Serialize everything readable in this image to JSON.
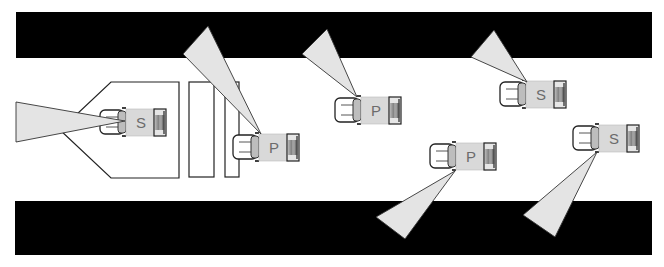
{
  "diagram": {
    "colors": {
      "background": "#ffffff",
      "barrier": "#000000",
      "cone_fill": "#e4e4e4",
      "cone_stroke": "#333333",
      "truck_cargo": "#d9d9d9",
      "truck_cab": "#ffffff",
      "truck_windshield": "#bdbdbd",
      "label": "#6b6b6b"
    },
    "barriers": [
      {
        "name": "top-wall",
        "x": 16,
        "y": 12,
        "w": 636,
        "h": 46
      },
      {
        "name": "bottom-wall",
        "x": 15,
        "y": 201,
        "w": 637,
        "h": 54
      }
    ],
    "structures": {
      "pentagon_zone": "111,82 179,82 179,178 111,178 60,130",
      "rects": [
        {
          "name": "bay-1",
          "x": 189,
          "y": 82,
          "w": 25,
          "h": 95
        },
        {
          "name": "bay-2",
          "x": 225,
          "y": 82,
          "w": 14,
          "h": 95
        }
      ]
    },
    "vehicles": [
      {
        "id": "s1",
        "label": "S",
        "type": "sensor-vehicle",
        "x": 100,
        "y": 108,
        "cone": "125,121 16,102 16,142"
      },
      {
        "id": "p1",
        "label": "P",
        "type": "pursuit-vehicle",
        "x": 233,
        "y": 133,
        "cone": "261,134 208,26 183,54"
      },
      {
        "id": "p2",
        "label": "P",
        "type": "pursuit-vehicle",
        "x": 335,
        "y": 96,
        "cone": "357,97 327,29 302,54"
      },
      {
        "id": "s2",
        "label": "S",
        "type": "sensor-vehicle",
        "x": 500,
        "y": 80,
        "cone": "527,82 494,30 471,57"
      },
      {
        "id": "p3",
        "label": "P",
        "type": "pursuit-vehicle",
        "x": 430,
        "y": 142,
        "cone": "455,171 376,217 405,239"
      },
      {
        "id": "s3",
        "label": "S",
        "type": "sensor-vehicle",
        "x": 573,
        "y": 124,
        "cone": "597,152 523,215 555,237"
      }
    ]
  }
}
